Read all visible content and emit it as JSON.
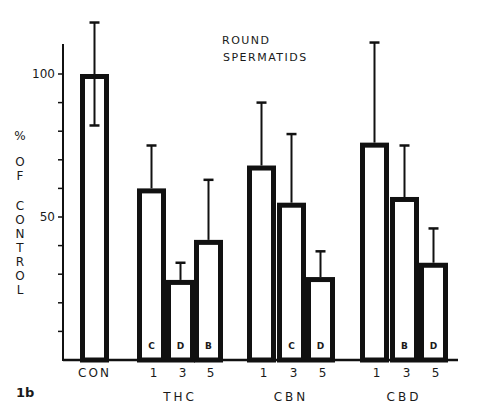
{
  "chart_data": {
    "type": "bar",
    "title_lines": [
      "ROUND",
      "SPERMATIDS"
    ],
    "panel_label": "1b",
    "xlabel": "",
    "ylabel": "% OF CONTROL",
    "ylabel_chars": [
      "%",
      "O",
      "F",
      "C",
      "O",
      "N",
      "T",
      "R",
      "O",
      "L"
    ],
    "ylim": [
      0,
      110
    ],
    "yticks": [
      10,
      20,
      30,
      40,
      50,
      60,
      70,
      80,
      90,
      100
    ],
    "ytick_labels": [
      {
        "value": 50,
        "label": "50"
      },
      {
        "value": 100,
        "label": "100"
      }
    ],
    "grid": false,
    "legend": null,
    "groups": [
      {
        "name": "CON",
        "bars": [
          {
            "label": "",
            "value": 100,
            "error_high": 118,
            "error_low": 82,
            "sig": ""
          }
        ]
      },
      {
        "name": "THC",
        "bars": [
          {
            "label": "1",
            "value": 60,
            "error_high": 75,
            "error_low": null,
            "sig": "C"
          },
          {
            "label": "3",
            "value": 28,
            "error_high": 34,
            "error_low": null,
            "sig": "D"
          },
          {
            "label": "5",
            "value": 42,
            "error_high": 63,
            "error_low": null,
            "sig": "B"
          }
        ]
      },
      {
        "name": "CBN",
        "bars": [
          {
            "label": "1",
            "value": 68,
            "error_high": 90,
            "error_low": null,
            "sig": ""
          },
          {
            "label": "3",
            "value": 55,
            "error_high": 79,
            "error_low": null,
            "sig": "C"
          },
          {
            "label": "5",
            "value": 29,
            "error_high": 38,
            "error_low": null,
            "sig": "D"
          }
        ]
      },
      {
        "name": "CBD",
        "bars": [
          {
            "label": "1",
            "value": 76,
            "error_high": 111,
            "error_low": null,
            "sig": ""
          },
          {
            "label": "3",
            "value": 57,
            "error_high": 75,
            "error_low": null,
            "sig": "B"
          },
          {
            "label": "5",
            "value": 34,
            "error_high": 46,
            "error_low": null,
            "sig": "D"
          }
        ]
      }
    ],
    "categories": [
      "CON",
      "THC 1",
      "THC 3",
      "THC 5",
      "CBN 1",
      "CBN 3",
      "CBN 5",
      "CBD 1",
      "CBD 3",
      "CBD 5"
    ],
    "values": [
      100,
      60,
      28,
      42,
      68,
      55,
      29,
      76,
      57,
      34
    ],
    "error_upper": [
      118,
      75,
      34,
      63,
      90,
      79,
      38,
      111,
      75,
      46
    ],
    "significance": [
      "",
      "C",
      "D",
      "B",
      "",
      "C",
      "D",
      "",
      "B",
      "D"
    ]
  }
}
